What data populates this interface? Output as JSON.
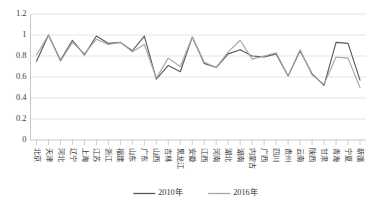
{
  "chart_data": {
    "type": "line",
    "title": "",
    "xlabel": "",
    "ylabel": "",
    "ylim": [
      0,
      1.2
    ],
    "ytick_values": [
      0,
      0.2,
      0.4,
      0.6,
      0.8,
      1,
      1.2
    ],
    "ytick_labels": [
      "0",
      "0.2",
      "0.4",
      "0.6",
      "0.8",
      "1",
      "1.2"
    ],
    "grid": true,
    "legend_position": "bottom",
    "categories": [
      "北京",
      "天津",
      "河北",
      "辽宁",
      "上海",
      "江苏",
      "浙江",
      "福建",
      "山东",
      "广东",
      "山西",
      "吉林",
      "黑龙江",
      "安徽",
      "江西",
      "河南",
      "湖北",
      "湖南",
      "内蒙古",
      "广西",
      "四川",
      "贵州",
      "云南",
      "陕西",
      "甘肃",
      "青海",
      "宁夏",
      "新疆"
    ],
    "series": [
      {
        "name": "2010年",
        "color": "#595959",
        "values": [
          0.75,
          1.0,
          0.76,
          0.95,
          0.81,
          0.99,
          0.92,
          0.93,
          0.85,
          0.99,
          0.58,
          0.71,
          0.65,
          0.98,
          0.73,
          0.69,
          0.82,
          0.86,
          0.8,
          0.79,
          0.82,
          0.61,
          0.85,
          0.63,
          0.52,
          0.93,
          0.92,
          0.57
        ]
      },
      {
        "name": "2016年",
        "color": "#a6a6a6",
        "values": [
          0.81,
          1.0,
          0.75,
          0.93,
          0.82,
          0.96,
          0.91,
          0.93,
          0.84,
          0.91,
          0.59,
          0.78,
          0.7,
          0.98,
          0.74,
          0.69,
          0.84,
          0.95,
          0.77,
          0.8,
          0.83,
          0.61,
          0.86,
          0.62,
          0.53,
          0.79,
          0.78,
          0.5
        ]
      }
    ]
  },
  "legend": {
    "entries": [
      {
        "label": "2010年",
        "color": "#595959"
      },
      {
        "label": "2016年",
        "color": "#a6a6a6"
      }
    ]
  }
}
